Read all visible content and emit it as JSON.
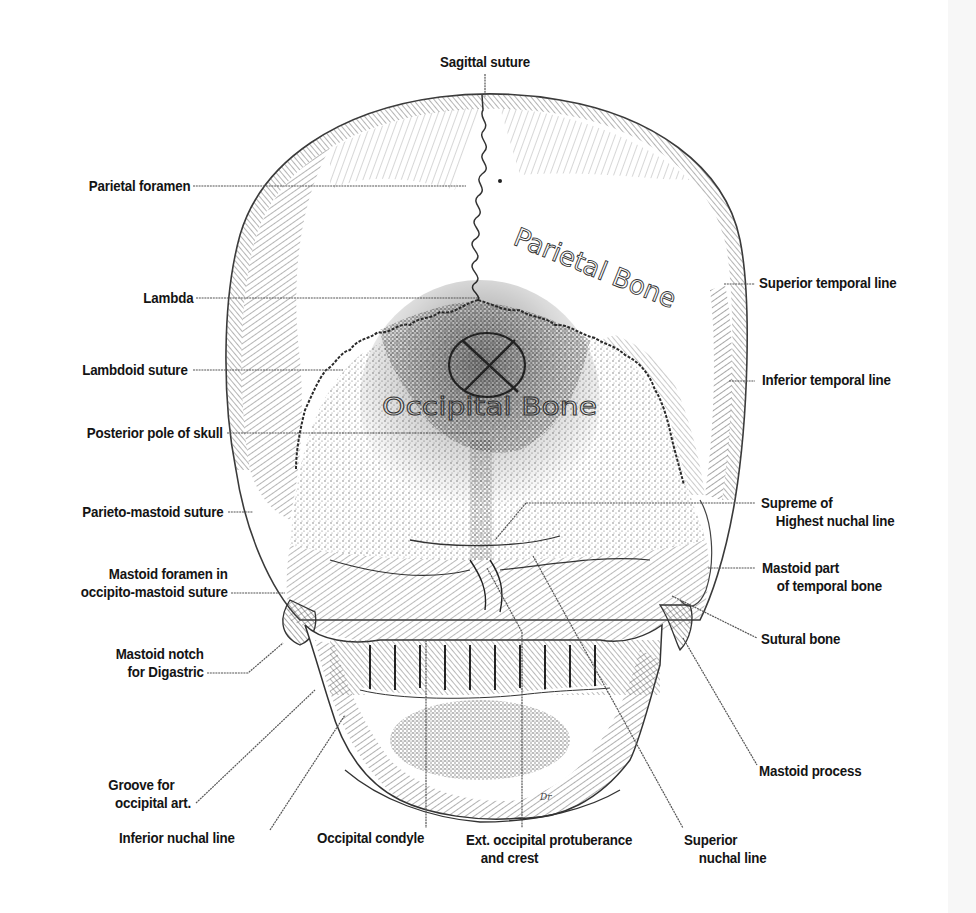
{
  "figure": {
    "handwritten_annotations": {
      "parietal": "Parietal Bone",
      "occipital": "Occipital Bone"
    },
    "signature": "Dr"
  },
  "labels": {
    "left": [
      {
        "id": "parietal-foramen",
        "lines": [
          "Parietal foramen"
        ]
      },
      {
        "id": "lambda",
        "lines": [
          "Lambda"
        ]
      },
      {
        "id": "lambdoid-suture",
        "lines": [
          "Lambdoid suture"
        ]
      },
      {
        "id": "posterior-pole",
        "lines": [
          "Posterior pole of skull"
        ]
      },
      {
        "id": "parieto-mastoid-suture",
        "lines": [
          "Parieto-mastoid suture"
        ]
      },
      {
        "id": "mastoid-foramen",
        "lines": [
          "Mastoid foramen in",
          "occipito-mastoid suture"
        ]
      },
      {
        "id": "mastoid-notch",
        "lines": [
          "Mastoid notch",
          "for Digastric"
        ]
      },
      {
        "id": "groove-occipital-art",
        "lines": [
          "Groove for",
          "occipital art."
        ]
      }
    ],
    "top": [
      {
        "id": "sagittal-suture",
        "lines": [
          "Sagittal suture"
        ]
      }
    ],
    "right": [
      {
        "id": "superior-temporal-line",
        "lines": [
          "Superior temporal line"
        ]
      },
      {
        "id": "inferior-temporal-line",
        "lines": [
          "Inferior temporal line"
        ]
      },
      {
        "id": "supreme-nuchal-line",
        "lines": [
          "Supreme of",
          "Highest nuchal line"
        ]
      },
      {
        "id": "mastoid-part-temporal",
        "lines": [
          "Mastoid part",
          "of temporal bone"
        ]
      },
      {
        "id": "sutural-bone",
        "lines": [
          "Sutural bone"
        ]
      },
      {
        "id": "mastoid-process",
        "lines": [
          "Mastoid process"
        ]
      }
    ],
    "bottom": [
      {
        "id": "inferior-nuchal-line",
        "lines": [
          "Inferior nuchal line"
        ]
      },
      {
        "id": "occipital-condyle",
        "lines": [
          "Occipital condyle"
        ]
      },
      {
        "id": "ext-occipital-protuberance",
        "lines": [
          "Ext. occipital protuberance",
          "and crest"
        ]
      },
      {
        "id": "superior-nuchal-line",
        "lines": [
          "Superior",
          "nuchal line"
        ]
      }
    ]
  },
  "colors": {
    "ink": "#141414",
    "hatch": "#555555",
    "background": "#ffffff"
  }
}
